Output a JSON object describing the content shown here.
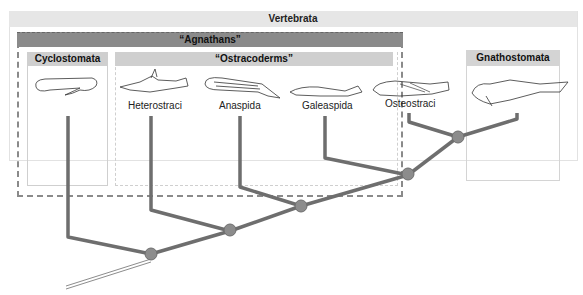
{
  "diagram": {
    "type": "cladogram",
    "groups": {
      "vertebrata": "Vertebrata",
      "agnathans": "“Agnathans”",
      "cyclostomata": "Cyclostomata",
      "ostracoderms": "“Ostracoderms”",
      "gnathostomata": "Gnathostomata"
    },
    "taxa": [
      {
        "label": "Heterostraci"
      },
      {
        "label": "Anaspida"
      },
      {
        "label": "Galeaspida"
      },
      {
        "label": "Osteostraci"
      }
    ],
    "nodes": 4,
    "colors": {
      "branch": "#6e6e6e",
      "node": "#8c8c8c",
      "agnathans_header": "#8a8a8a",
      "subgroup_header": "#cfcfcf",
      "outer_header": "#e6e6e6"
    }
  }
}
